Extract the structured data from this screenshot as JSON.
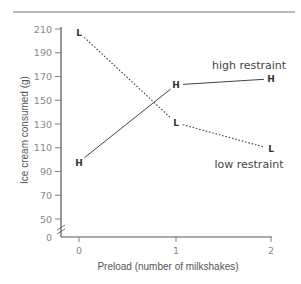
{
  "chart_data": {
    "type": "line",
    "title": "",
    "xlabel": "Preload (number of milkshakes)",
    "ylabel": "Ice cream consumed (g)",
    "x": [
      0,
      1,
      2
    ],
    "x_ticks": [
      "0",
      "1",
      "2"
    ],
    "y_ticks": [
      "0",
      "50",
      "70",
      "90",
      "110",
      "130",
      "150",
      "170",
      "190",
      "210"
    ],
    "ylim": [
      0,
      210
    ],
    "y_axis_break": true,
    "grid": false,
    "legend_position": "inline labels",
    "series": [
      {
        "name": "high restraint",
        "marker": "H",
        "line_style": "solid",
        "values": [
          98,
          163,
          168
        ]
      },
      {
        "name": "low restraint",
        "marker": "L",
        "line_style": "dotted",
        "values": [
          207,
          131,
          109
        ]
      }
    ]
  },
  "labels": {
    "high": "high restraint",
    "low": "low restraint",
    "marker_high": "H",
    "marker_low": "L"
  }
}
